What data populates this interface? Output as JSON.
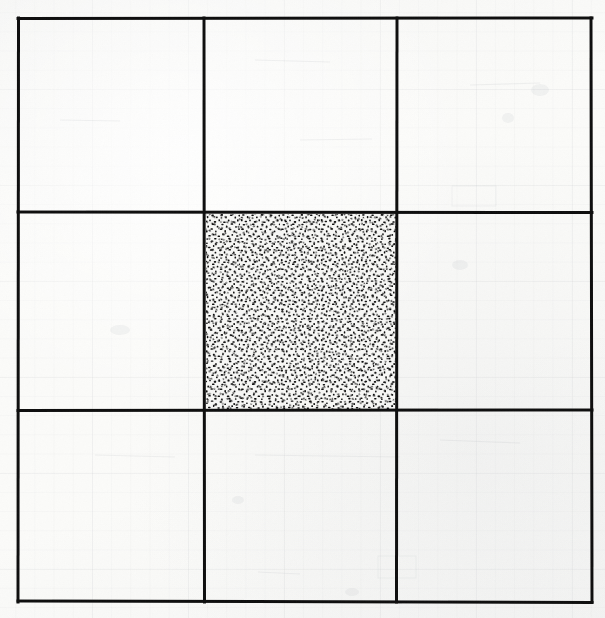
{
  "figure": {
    "description": "A hand-ruled three-by-three grid of squares drawn in heavy black ink on off-white graph paper. The single centre cell is completely filled with a dense random stipple (speckled dot) texture; the other eight cells are empty.",
    "medium": "photocopied ink drawing on faintly ruled graph paper",
    "width_px": 605,
    "height_px": 618
  },
  "colors": {
    "paper": "#fbfbf9",
    "ink": "#101010",
    "ghost_rule": "#787d87",
    "stipple": "#111111",
    "stipple_background": "#f7f7f5"
  },
  "grid": {
    "rows": 3,
    "columns": 3,
    "cell_count": 9,
    "line_width_px": 3,
    "outer_border": {
      "left": 18,
      "top": 18,
      "right": 592,
      "bottom": 602
    },
    "vertical_line_x": [
      18,
      204,
      397,
      592
    ],
    "horizontal_line_y": [
      18,
      212,
      410,
      602
    ],
    "column_widths_px": [
      186,
      193,
      195
    ],
    "row_heights_px": [
      194,
      198,
      192
    ]
  },
  "cells": [
    {
      "id": "r1c1",
      "row": 1,
      "column": 1,
      "fill": "empty",
      "label": "top-left cell"
    },
    {
      "id": "r1c2",
      "row": 1,
      "column": 2,
      "fill": "empty",
      "label": "top-centre cell"
    },
    {
      "id": "r1c3",
      "row": 1,
      "column": 3,
      "fill": "empty",
      "label": "top-right cell"
    },
    {
      "id": "r2c1",
      "row": 2,
      "column": 1,
      "fill": "empty",
      "label": "middle-left cell"
    },
    {
      "id": "r2c2",
      "row": 2,
      "column": 2,
      "fill": "stipple",
      "label": "centre cell (stippled)"
    },
    {
      "id": "r2c3",
      "row": 2,
      "column": 3,
      "fill": "empty",
      "label": "middle-right cell"
    },
    {
      "id": "r3c1",
      "row": 3,
      "column": 1,
      "fill": "empty",
      "label": "bottom-left cell"
    },
    {
      "id": "r3c2",
      "row": 3,
      "column": 2,
      "fill": "empty",
      "label": "bottom-centre cell"
    },
    {
      "id": "r3c3",
      "row": 3,
      "column": 3,
      "fill": "empty",
      "label": "bottom-right cell"
    }
  ],
  "stipple_region": {
    "left": 206,
    "top": 214,
    "width": 191,
    "height": 196,
    "pattern": "dense random dots and short dashes",
    "coverage_estimate_percent": 45,
    "dot_size_px": "1-3"
  },
  "chart_data": {
    "type": "heatmap",
    "xlabel": "",
    "ylabel": "",
    "categories": [
      "column 1",
      "column 2",
      "column 3"
    ],
    "row_labels": [
      "row 1",
      "row 2",
      "row 3"
    ],
    "values": [
      [
        0,
        0,
        0
      ],
      [
        0,
        1,
        0
      ],
      [
        0,
        0,
        0
      ]
    ],
    "legend": [
      {
        "value": 0,
        "label": "empty",
        "swatch": "#fbfbf9"
      },
      {
        "value": 1,
        "label": "stippled",
        "swatch": "#7a7a7a"
      }
    ],
    "grid": true,
    "legend_position": "none"
  }
}
